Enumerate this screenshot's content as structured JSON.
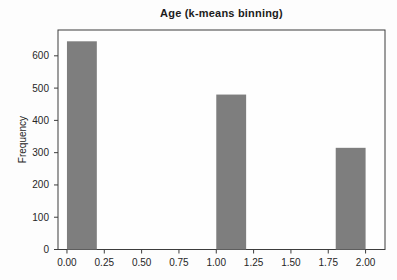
{
  "chart_data": {
    "type": "bar",
    "title": "Age (k-means binning)",
    "xlabel": "",
    "ylabel": "Frequency",
    "categories": [
      "0",
      "1",
      "2"
    ],
    "values": [
      645,
      480,
      315
    ],
    "bars": [
      {
        "x_start": 0.0,
        "x_end": 0.2,
        "value": 645
      },
      {
        "x_start": 1.0,
        "x_end": 1.2,
        "value": 480
      },
      {
        "x_start": 1.8,
        "x_end": 2.0,
        "value": 315
      }
    ],
    "x_ticks": [
      0.0,
      0.25,
      0.5,
      0.75,
      1.0,
      1.25,
      1.5,
      1.75,
      2.0
    ],
    "x_tick_labels": [
      "0.00",
      "0.25",
      "0.50",
      "0.75",
      "1.00",
      "1.25",
      "1.50",
      "1.75",
      "2.00"
    ],
    "y_ticks": [
      0,
      100,
      200,
      300,
      400,
      500,
      600
    ],
    "y_tick_labels": [
      "0",
      "100",
      "200",
      "300",
      "400",
      "500",
      "600"
    ],
    "xlim": [
      -0.06,
      2.13
    ],
    "ylim": [
      0,
      680
    ],
    "grid": false,
    "legend": null,
    "bar_color": "#7e7e7e",
    "plot_bg_color": "#fefefe",
    "axis_color": "#3d3d3d",
    "text_color": "#262626",
    "title_color": "#1c1c1c"
  }
}
